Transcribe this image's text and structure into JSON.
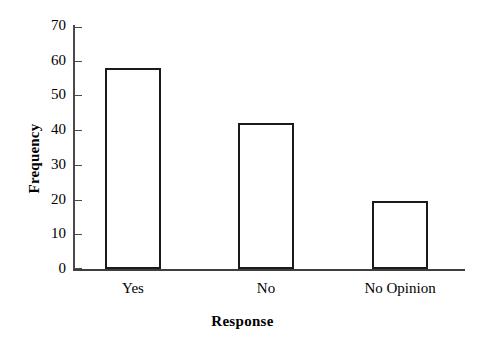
{
  "chart_data": {
    "type": "bar",
    "title": "",
    "subtitle": "",
    "categories": [
      "Yes",
      "No",
      "No Opinion"
    ],
    "values": [
      58,
      42,
      19.5
    ],
    "xlabel": "Response",
    "ylabel": "Frequency",
    "ylim": [
      0,
      70
    ],
    "ytick_labels": [
      "70",
      "60",
      "50",
      "40",
      "30",
      "20",
      "10",
      "0"
    ],
    "ytick_values": [
      70,
      60,
      50,
      40,
      30,
      20,
      10,
      0
    ],
    "ytick_step": 10,
    "grid": false,
    "legend": false,
    "legend_position": "none",
    "bar_fill_color": "#ffffff",
    "bar_edge_color": "#1a1a1a",
    "axis_color": "#3f3f3f",
    "background_color": "#ffffff",
    "text_color": "#000000",
    "annotations": []
  },
  "axis": {
    "y_title": "Frequency",
    "x_title": "Response"
  }
}
